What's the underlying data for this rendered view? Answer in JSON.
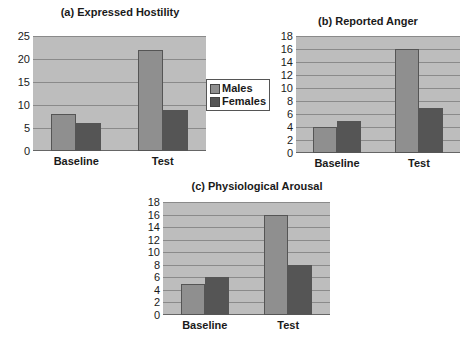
{
  "colors": {
    "male": "#8f8f8f",
    "female": "#555555",
    "plot_bg": "#bdbdbd",
    "grid": "#8a8a8a"
  },
  "legend": {
    "items": [
      {
        "label": "Males",
        "color": "#8f8f8f"
      },
      {
        "label": "Females",
        "color": "#555555"
      }
    ]
  },
  "chart_data": [
    {
      "type": "bar",
      "title": "(a) Expressed Hostility",
      "categories": [
        "Baseline",
        "Test"
      ],
      "series": [
        {
          "name": "Males",
          "values": [
            8,
            22
          ]
        },
        {
          "name": "Females",
          "values": [
            6,
            9
          ]
        }
      ],
      "xlabel": "",
      "ylabel": "",
      "ylim": [
        0,
        25
      ],
      "yticks": [
        0,
        5,
        10,
        15,
        20,
        25
      ],
      "grid": true,
      "legend_position": "right"
    },
    {
      "type": "bar",
      "title": "(b) Reported Anger",
      "categories": [
        "Baseline",
        "Test"
      ],
      "series": [
        {
          "name": "Males",
          "values": [
            4,
            16
          ]
        },
        {
          "name": "Females",
          "values": [
            5,
            7
          ]
        }
      ],
      "xlabel": "",
      "ylabel": "",
      "ylim": [
        0,
        18
      ],
      "yticks": [
        0,
        2,
        4,
        6,
        8,
        10,
        12,
        14,
        16,
        18
      ],
      "grid": true
    },
    {
      "type": "bar",
      "title": "(c) Physiological Arousal",
      "categories": [
        "Baseline",
        "Test"
      ],
      "series": [
        {
          "name": "Males",
          "values": [
            5,
            16
          ]
        },
        {
          "name": "Females",
          "values": [
            6,
            8
          ]
        }
      ],
      "xlabel": "",
      "ylabel": "",
      "ylim": [
        0,
        18
      ],
      "yticks": [
        0,
        2,
        4,
        6,
        8,
        10,
        12,
        14,
        16,
        18
      ],
      "grid": true
    }
  ]
}
